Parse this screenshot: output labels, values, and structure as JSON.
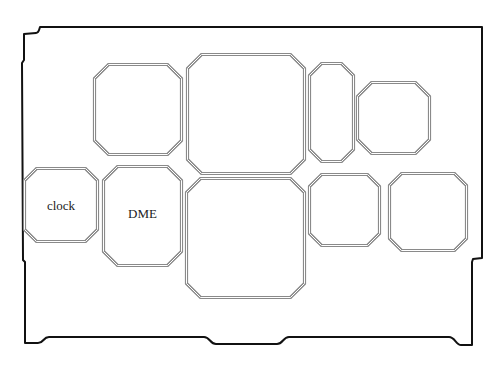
{
  "diagram": {
    "type": "board-layout",
    "background": "#ffffff",
    "outline_color": "#111111",
    "module_border_color": "#8a8a8a",
    "board_outline": {
      "path": "M40,27 L482,27 L482,258 L473,259 L472,262 L472,345 L461,345 C456,345 455,337 449,337 L289,337 C283,337 283,344 277,344 L216,344 C210,344 210,337 204,337 L49,337 C43,337 44,343 38,343 L25,343 L25,262 L23,260 L22,63 L24,60 L24,34 L36,33 C39,33 39,30 40,27 Z"
    },
    "modules": [
      {
        "id": "m1",
        "label": "",
        "x": 93,
        "y": 63,
        "w": 90,
        "h": 93,
        "chamfer": 14
      },
      {
        "id": "m2",
        "label": "",
        "x": 186,
        "y": 53,
        "w": 120,
        "h": 122,
        "chamfer": 14
      },
      {
        "id": "m3",
        "label": "",
        "x": 308,
        "y": 62,
        "w": 47,
        "h": 101,
        "chamfer": 12
      },
      {
        "id": "m4",
        "label": "",
        "x": 356,
        "y": 81,
        "w": 75,
        "h": 74,
        "chamfer": 14
      },
      {
        "id": "m5",
        "label": "clock",
        "x": 23,
        "y": 167,
        "w": 76,
        "h": 76,
        "chamfer": 12
      },
      {
        "id": "m6",
        "label": "DME",
        "x": 102,
        "y": 165,
        "w": 81,
        "h": 102,
        "chamfer": 14
      },
      {
        "id": "m7",
        "label": "",
        "x": 185,
        "y": 177,
        "w": 121,
        "h": 122,
        "chamfer": 14
      },
      {
        "id": "m8",
        "label": "",
        "x": 308,
        "y": 173,
        "w": 73,
        "h": 74,
        "chamfer": 12
      },
      {
        "id": "m9",
        "label": "",
        "x": 388,
        "y": 172,
        "w": 80,
        "h": 80,
        "chamfer": 12
      }
    ],
    "labels": {
      "clock": "clock",
      "dme": "DME"
    }
  }
}
